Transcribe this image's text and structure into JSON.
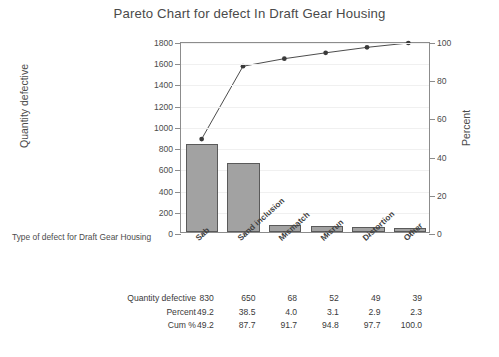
{
  "chart_data": {
    "type": "bar",
    "title": "Pareto Chart for defect In Draft Gear Housing",
    "xlabel": "Type of defect for Draft Gear Housing",
    "ylabel": "Quantity defective",
    "ylabel_secondary": "Percent",
    "categories": [
      "Sab",
      "Sand inclusion",
      "Mismatch",
      "Misrun",
      "Distortion",
      "Other"
    ],
    "values": [
      830,
      650,
      68,
      52,
      49,
      39
    ],
    "series": [
      {
        "name": "Quantity defective",
        "values": [
          830,
          650,
          68,
          52,
          49,
          39
        ]
      },
      {
        "name": "Cum %",
        "values": [
          49.2,
          87.7,
          91.7,
          94.8,
          97.7,
          100.0
        ]
      }
    ],
    "percent": [
      49.2,
      38.5,
      4.0,
      3.1,
      2.9,
      2.3
    ],
    "ylim": [
      0,
      1800
    ],
    "ylim_secondary": [
      0,
      100
    ],
    "yticks": [
      0,
      200,
      400,
      600,
      800,
      1000,
      1200,
      1400,
      1600,
      1800
    ],
    "yticks_secondary": [
      0,
      20,
      40,
      60,
      80,
      100
    ],
    "ytick_labels": [
      "0",
      "200",
      "400",
      "600",
      "800",
      "1000",
      "1200",
      "1400",
      "1600",
      "1800"
    ],
    "ytick_labels_secondary": [
      "0",
      "20",
      "40",
      "60",
      "80",
      "100"
    ],
    "grid": true,
    "legend": "none",
    "bar_color": "#a2a2a2",
    "bar_border_color": "#5a5a5a",
    "line_color": "#4a4a4a",
    "marker_color": "#3a3a3a",
    "axis_color": "#8c8c8c"
  },
  "table": {
    "rows": [
      {
        "label": "Quantity defective",
        "cells": [
          "830",
          "650",
          "68",
          "52",
          "49",
          "39"
        ]
      },
      {
        "label": "Percent",
        "cells": [
          "49.2",
          "38.5",
          "4.0",
          "3.1",
          "2.9",
          "2.3"
        ]
      },
      {
        "label": "Cum %",
        "cells": [
          "49.2",
          "87.7",
          "91.7",
          "94.8",
          "97.7",
          "100.0"
        ]
      }
    ]
  },
  "caption": {
    "text": ""
  }
}
